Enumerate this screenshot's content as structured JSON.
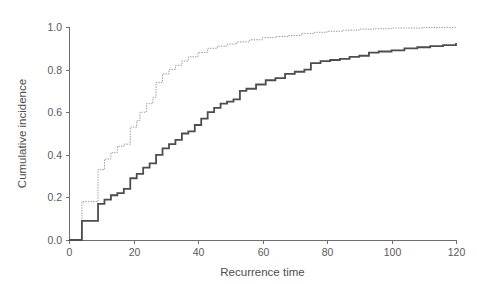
{
  "chart_data": {
    "type": "line",
    "title": "",
    "subtitle": "",
    "xlabel": "Recurrence time",
    "ylabel": "Cumulative incidence",
    "xlim": [
      0,
      120
    ],
    "ylim": [
      0.0,
      1.0
    ],
    "grid": false,
    "legend": "none",
    "xticks": [
      0,
      20,
      40,
      60,
      80,
      100,
      120
    ],
    "xticklabels": [
      "0",
      "20",
      "40",
      "60",
      "80",
      "100",
      "120"
    ],
    "yticks": [
      0.0,
      0.2,
      0.4,
      0.6,
      0.8,
      1.0
    ],
    "yticklabels": [
      "0.0",
      "0.2",
      "0.4",
      "0.6",
      "0.8",
      "1.0"
    ],
    "series": [
      {
        "name": "upper-curve",
        "style": "dotted",
        "color": "#9a9a9a",
        "linewidth": 1.0,
        "step": "post",
        "x": [
          0,
          3,
          4,
          8,
          9,
          11,
          13,
          15,
          17,
          19,
          21,
          22,
          24,
          26,
          27,
          29,
          31,
          33,
          35,
          37,
          40,
          43,
          46,
          49,
          52,
          56,
          60,
          64,
          68,
          72,
          76,
          80,
          85,
          90,
          95,
          100,
          110,
          120
        ],
        "y": [
          0.0,
          0.0,
          0.18,
          0.18,
          0.33,
          0.38,
          0.41,
          0.44,
          0.45,
          0.53,
          0.56,
          0.6,
          0.64,
          0.67,
          0.74,
          0.78,
          0.8,
          0.82,
          0.84,
          0.86,
          0.88,
          0.9,
          0.91,
          0.92,
          0.93,
          0.94,
          0.95,
          0.955,
          0.96,
          0.97,
          0.975,
          0.98,
          0.985,
          0.99,
          0.992,
          0.995,
          0.998,
          1.0
        ]
      },
      {
        "name": "lower-curve",
        "style": "solid",
        "color": "#4d4d4d",
        "linewidth": 1.8,
        "step": "post",
        "x": [
          0,
          3,
          4,
          8,
          9,
          11,
          13,
          15,
          17,
          19,
          21,
          23,
          25,
          27,
          29,
          31,
          33,
          35,
          37,
          39,
          41,
          43,
          45,
          47,
          49,
          51,
          53,
          55,
          58,
          61,
          64,
          67,
          70,
          73,
          75,
          78,
          81,
          84,
          87,
          90,
          93,
          96,
          100,
          104,
          108,
          112,
          116,
          120
        ],
        "y": [
          0.0,
          0.0,
          0.09,
          0.09,
          0.17,
          0.19,
          0.21,
          0.22,
          0.24,
          0.29,
          0.31,
          0.34,
          0.36,
          0.4,
          0.43,
          0.45,
          0.47,
          0.5,
          0.51,
          0.54,
          0.57,
          0.6,
          0.62,
          0.64,
          0.65,
          0.66,
          0.7,
          0.71,
          0.73,
          0.75,
          0.76,
          0.78,
          0.79,
          0.8,
          0.83,
          0.84,
          0.845,
          0.85,
          0.86,
          0.865,
          0.88,
          0.885,
          0.89,
          0.9,
          0.905,
          0.91,
          0.915,
          0.925
        ]
      }
    ]
  },
  "axes": {
    "x_title": "Recurrence time",
    "y_title": "Cumulative incidence"
  }
}
